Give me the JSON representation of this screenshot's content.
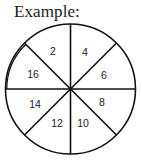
{
  "title": "Example:",
  "diagram": {
    "type": "sectored-circle",
    "sectors_count": 8,
    "line_color": "#111111",
    "background": "#ffffff",
    "highlighted_sector": "16",
    "highlight_style": "double-outer-arc",
    "sectors": [
      {
        "position": "top-left",
        "label": "2"
      },
      {
        "position": "top-right",
        "label": "4"
      },
      {
        "position": "right-upper",
        "label": "6"
      },
      {
        "position": "right-lower",
        "label": "8"
      },
      {
        "position": "bottom-right",
        "label": "10"
      },
      {
        "position": "bottom-left",
        "label": "12"
      },
      {
        "position": "left-lower",
        "label": "14"
      },
      {
        "position": "left-upper",
        "label": "16"
      }
    ]
  }
}
